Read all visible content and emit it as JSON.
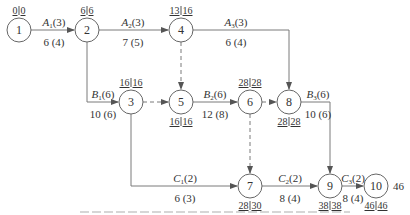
{
  "diagram": {
    "type": "double-code activity network (arrow diagram) with time parameters",
    "nodes": [
      {
        "id": "1",
        "x": 19,
        "y": 30,
        "times": [
          "0",
          "0"
        ],
        "times_pos": "top"
      },
      {
        "id": "2",
        "x": 87,
        "y": 30,
        "times": [
          "6",
          "6"
        ],
        "times_pos": "top"
      },
      {
        "id": "4",
        "x": 181,
        "y": 30,
        "times": [
          "13",
          "16"
        ],
        "times_pos": "top"
      },
      {
        "id": "3",
        "x": 131,
        "y": 102,
        "times": [
          "16",
          "16"
        ],
        "times_pos": "top"
      },
      {
        "id": "5",
        "x": 181,
        "y": 102,
        "times": [
          "16",
          "16"
        ],
        "times_pos": "bottom"
      },
      {
        "id": "6",
        "x": 250,
        "y": 102,
        "times": [
          "28",
          "28"
        ],
        "times_pos": "top"
      },
      {
        "id": "8",
        "x": 289,
        "y": 102,
        "times": [
          "28",
          "28"
        ],
        "times_pos": "bottom"
      },
      {
        "id": "7",
        "x": 250,
        "y": 186,
        "times": [
          "28",
          "30"
        ],
        "times_pos": "bottom"
      },
      {
        "id": "9",
        "x": 330,
        "y": 186,
        "times": [
          "38",
          "38"
        ],
        "times_pos": "bottom"
      },
      {
        "id": "10",
        "x": 376,
        "y": 186,
        "times": [
          "46",
          "46"
        ],
        "times_pos": "bottom"
      }
    ],
    "activities": [
      {
        "from": "1",
        "to": "2",
        "name": "A",
        "sub": "1",
        "resource": "(3)",
        "duration": "6 (4)"
      },
      {
        "from": "2",
        "to": "4",
        "name": "A",
        "sub": "2",
        "resource": "(3)",
        "duration": "7 (5)"
      },
      {
        "from": "4",
        "to": "8",
        "name": "A",
        "sub": "3",
        "resource": "(3)",
        "duration": "6 (4)"
      },
      {
        "from": "2",
        "to": "3",
        "name": "B",
        "sub": "1",
        "resource": "(6)",
        "duration": "10 (6)"
      },
      {
        "from": "5",
        "to": "6",
        "name": "B",
        "sub": "2",
        "resource": "(6)",
        "duration": "12 (8)"
      },
      {
        "from": "8",
        "to": "9",
        "name": "B",
        "sub": "3",
        "resource": "(6)",
        "duration": "10 (6)"
      },
      {
        "from": "3",
        "to": "7",
        "name": "C",
        "sub": "1",
        "resource": "(2)",
        "duration": "6 (3)"
      },
      {
        "from": "7",
        "to": "9",
        "name": "C",
        "sub": "2",
        "resource": "(2)",
        "duration": "8 (4)"
      },
      {
        "from": "9",
        "to": "10",
        "name": "C",
        "sub": "3",
        "resource": "(2)",
        "duration": "8 (4)"
      }
    ],
    "dummies": [
      {
        "from": "4",
        "to": "5"
      },
      {
        "from": "3",
        "to": "5"
      },
      {
        "from": "6",
        "to": "8"
      },
      {
        "from": "6",
        "to": "7"
      }
    ],
    "total_duration": "46"
  },
  "colors": {
    "line": "#7a7a7a",
    "text": "#333333",
    "background": "#ffffff"
  }
}
